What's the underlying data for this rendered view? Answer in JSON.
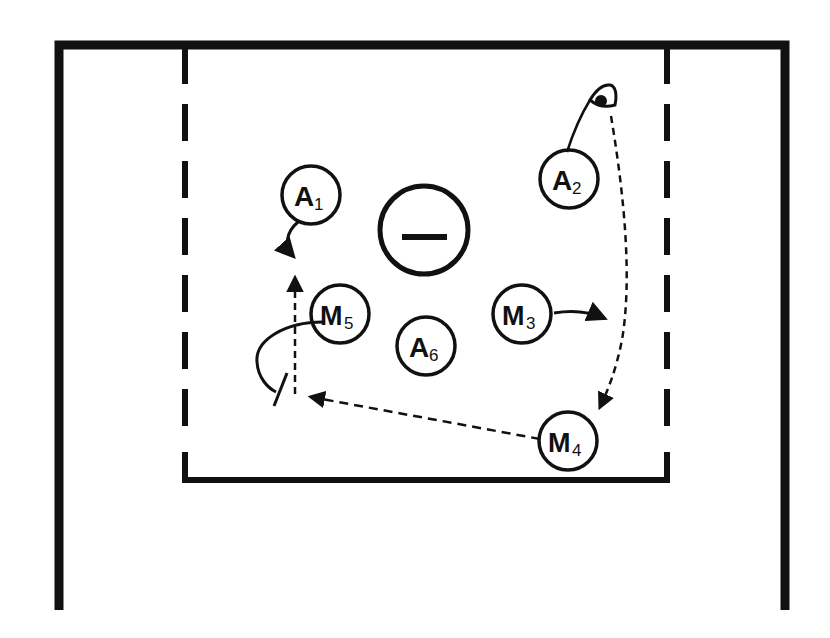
{
  "diagram": {
    "type": "sports-play-diagram",
    "colors": {
      "ink": "#111111",
      "background": "#ffffff"
    },
    "court": {
      "outer_frame": "solid",
      "zone_box": "dashed-sides-solid-bottom"
    },
    "center_marker": {
      "symbol": "minus-circle",
      "label": "−"
    },
    "players": [
      {
        "id": "A1",
        "letter": "A",
        "number": "1",
        "x": 311,
        "y": 195
      },
      {
        "id": "A2",
        "letter": "A",
        "number": "2",
        "x": 569,
        "y": 179
      },
      {
        "id": "M3",
        "letter": "M",
        "number": "3",
        "x": 522,
        "y": 314
      },
      {
        "id": "M4",
        "letter": "M",
        "number": "4",
        "x": 568,
        "y": 441
      },
      {
        "id": "M5",
        "letter": "M",
        "number": "5",
        "x": 340,
        "y": 314
      },
      {
        "id": "A6",
        "letter": "A",
        "number": "6",
        "x": 426,
        "y": 346
      }
    ],
    "ball": {
      "holder": "A2"
    },
    "movements": [
      {
        "from": "A1",
        "type": "cut",
        "style": "solid-curved-arrow"
      },
      {
        "from": "M3",
        "type": "cut",
        "style": "solid-curved-arrow"
      },
      {
        "from": "M5",
        "type": "screen",
        "style": "solid-curve-with-screen-bar"
      },
      {
        "from": "A2",
        "to": "M4",
        "type": "pass",
        "style": "dashed-arrow"
      },
      {
        "from": "M4",
        "to": "screen-spot",
        "type": "pass",
        "style": "dashed-arrow"
      },
      {
        "from": "screen-spot",
        "to": "A1-spot",
        "type": "pass",
        "style": "dashed-arrow"
      }
    ]
  }
}
